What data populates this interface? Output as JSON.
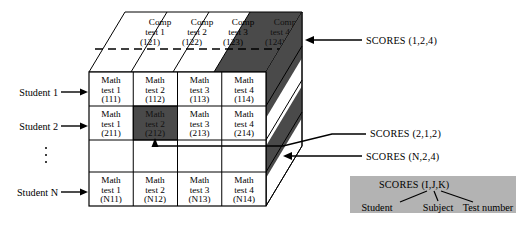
{
  "figure": {
    "kind": "3d-array-diagram",
    "colors": {
      "dark_shade": "#4a4a4a",
      "legend_background": "#b3b3b3",
      "line": "#000000",
      "face": "#ffffff"
    }
  },
  "top_face": {
    "label": "Comp layer (subject 2)",
    "cells": [
      {
        "line1": "Comp",
        "line2": "test 1",
        "line3": "(121)",
        "shaded": false
      },
      {
        "line1": "Comp",
        "line2": "test 2",
        "line3": "(122)",
        "shaded": false
      },
      {
        "line1": "Comp",
        "line2": "test 3",
        "line3": "(123)",
        "shaded": false
      },
      {
        "line1": "Comp",
        "line2": "test 4",
        "line3": "(124)",
        "shaded": true
      }
    ]
  },
  "front_face": {
    "label": "Math layer (subject 1)",
    "rows": [
      {
        "student_label": "Student 1",
        "has_arrow": true,
        "ellipsis": false,
        "cells": [
          {
            "line1": "Math",
            "line2": "test 1",
            "line3": "(111)",
            "shaded": false
          },
          {
            "line1": "Math",
            "line2": "test 2",
            "line3": "(112)",
            "shaded": false
          },
          {
            "line1": "Math",
            "line2": "test 3",
            "line3": "(113)",
            "shaded": false
          },
          {
            "line1": "Math",
            "line2": "test 4",
            "line3": "(114)",
            "shaded": false
          }
        ]
      },
      {
        "student_label": "Student 2",
        "has_arrow": true,
        "ellipsis": false,
        "cells": [
          {
            "line1": "Math",
            "line2": "test 1",
            "line3": "(211)",
            "shaded": false
          },
          {
            "line1": "Math",
            "line2": "test 2",
            "line3": "(212)",
            "shaded": true
          },
          {
            "line1": "Math",
            "line2": "test 3",
            "line3": "(213)",
            "shaded": false
          },
          {
            "line1": "Math",
            "line2": "test 4",
            "line3": "(214)",
            "shaded": false
          }
        ]
      },
      {
        "student_label": "",
        "has_arrow": false,
        "ellipsis": true,
        "cells": [
          {
            "line1": "",
            "line2": "",
            "line3": "",
            "shaded": false
          },
          {
            "line1": "",
            "line2": "",
            "line3": "",
            "shaded": false
          },
          {
            "line1": "",
            "line2": "",
            "line3": "",
            "shaded": false
          },
          {
            "line1": "",
            "line2": "",
            "line3": "",
            "shaded": false
          }
        ]
      },
      {
        "student_label": "Student N",
        "has_arrow": true,
        "ellipsis": false,
        "cells": [
          {
            "line1": "Math",
            "line2": "test 1",
            "line3": "(N11)",
            "shaded": false
          },
          {
            "line1": "Math",
            "line2": "test 2",
            "line3": "(N12)",
            "shaded": false
          },
          {
            "line1": "Math",
            "line2": "test 3",
            "line3": "(N13)",
            "shaded": false
          },
          {
            "line1": "Math",
            "line2": "test 4",
            "line3": "(N14)",
            "shaded": false
          }
        ]
      }
    ]
  },
  "annotations": [
    {
      "id": "scores-1-2-4",
      "text": "SCORES (1,2,4)"
    },
    {
      "id": "scores-2-1-2",
      "text": "SCORES (2,1,2)"
    },
    {
      "id": "scores-n-2-4",
      "text": "SCORES (N,2,4)"
    }
  ],
  "legend": {
    "title": "SCORES (I,J,K)",
    "parts": [
      {
        "label": "Student"
      },
      {
        "label": "Subject"
      },
      {
        "label": "Test number"
      }
    ]
  }
}
